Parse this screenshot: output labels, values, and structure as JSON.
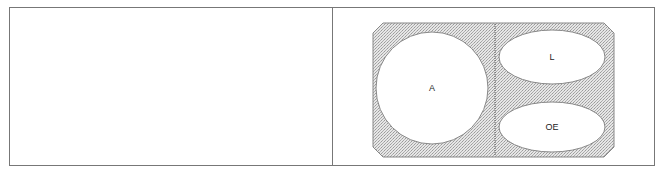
{
  "table": {
    "left_cell": {
      "content": ""
    },
    "right_cell": {
      "diagram": {
        "shapes": [
          {
            "id": "A",
            "label": "A",
            "kind": "circle"
          },
          {
            "id": "L",
            "label": "L",
            "kind": "ellipse"
          },
          {
            "id": "OE",
            "label": "OE",
            "kind": "ellipse"
          }
        ],
        "divider": "dashed-vertical",
        "colors": {
          "fill_pattern": "#c8c8c8",
          "outline": "#888888",
          "inner_fill": "#ffffff"
        }
      }
    }
  }
}
